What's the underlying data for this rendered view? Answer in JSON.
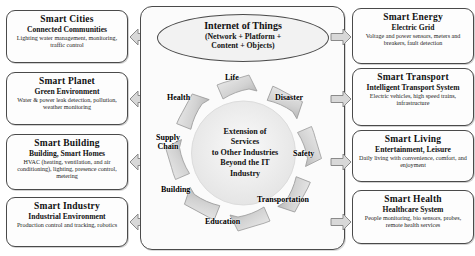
{
  "center": {
    "header": {
      "title": "Internet of Things",
      "subtitle_line1": "(Network + Platform +",
      "subtitle_line2": "Content + Objects)"
    },
    "core_text": {
      "line1": "Extension of",
      "line2": "Services",
      "line3": "to Other Industries",
      "line4": "Beyond the IT",
      "line5": "Industry"
    },
    "cycle_labels": [
      {
        "id": "life",
        "text": "Life"
      },
      {
        "id": "disaster",
        "text": "Disaster"
      },
      {
        "id": "safety",
        "text": "Safety"
      },
      {
        "id": "transportation",
        "text": "Transportation"
      },
      {
        "id": "education",
        "text": "Education"
      },
      {
        "id": "building",
        "text": "Building"
      },
      {
        "id": "supply-chain",
        "text": "Supply Chain"
      },
      {
        "id": "health",
        "text": "Health"
      }
    ]
  },
  "left_cards": [
    {
      "title": "Smart Cities",
      "subtitle": "Connected Communities",
      "detail": "Lighting water management, monitoring, traffic control"
    },
    {
      "title": "Smart Planet",
      "subtitle": "Green Environment",
      "detail": "Water & power leak detection, pollution, weather monitoring"
    },
    {
      "title": "Smart Building",
      "subtitle": "Building, Smart Homes",
      "detail": "HVAC (heating, ventilation, and air conditioning), lighting, presence control, metering"
    },
    {
      "title": "Smart Industry",
      "subtitle": "Industrial Environment",
      "detail": "Production control and tracking, robotics"
    }
  ],
  "right_cards": [
    {
      "title": "Smart Energy",
      "subtitle": "Electric Grid",
      "detail": "Voltage and power sensors, meters and breakers, fault detection"
    },
    {
      "title": "Smart Transport",
      "subtitle": "Intelligent Transport System",
      "detail": "Electric vehicles, high speed trains, infrastructure"
    },
    {
      "title": "Smart Living",
      "subtitle": "Entertainment, Leisure",
      "detail": "Daily living with convenience, comfort, and enjoyment"
    },
    {
      "title": "Smart Health",
      "subtitle": "Healthcare System",
      "detail": "People monitoring, bio sensors, probes, remote health services"
    }
  ],
  "colors": {
    "outline": "#4a4a4a",
    "arrow_fill": "#d8d8d8",
    "arrow_stroke": "#8a8a8a",
    "panel_bg": "#fbfbfb",
    "ellipse_bg": "#f2f2f2"
  }
}
